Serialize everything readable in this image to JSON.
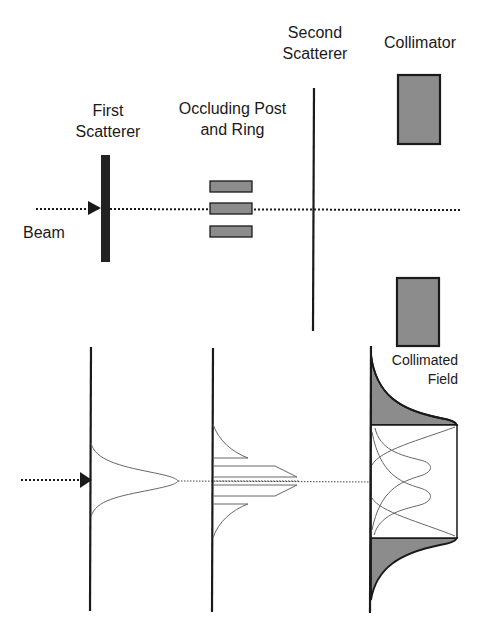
{
  "labels": {
    "first_scatterer": "First\nScatterer",
    "occluding": "Occluding Post\nand Ring",
    "second_scatterer": "Second\nScatterer",
    "collimator": "Collimator",
    "beam": "Beam",
    "collimated_field": "Collimated\nField"
  },
  "colors": {
    "stroke": "#1a1a1a",
    "fill_gray": "#8c8c8c",
    "curve": "#666666",
    "background": "#ffffff"
  }
}
